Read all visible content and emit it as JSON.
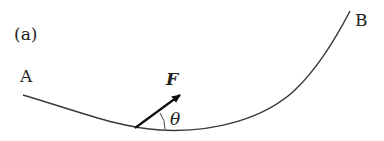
{
  "diagram": {
    "panel_label": "(a)",
    "point_a": "A",
    "point_b": "B",
    "force_label": "F",
    "angle_label": "θ",
    "colors": {
      "line": "#3a3a3a",
      "text": "#222222",
      "background": "#ffffff"
    }
  }
}
